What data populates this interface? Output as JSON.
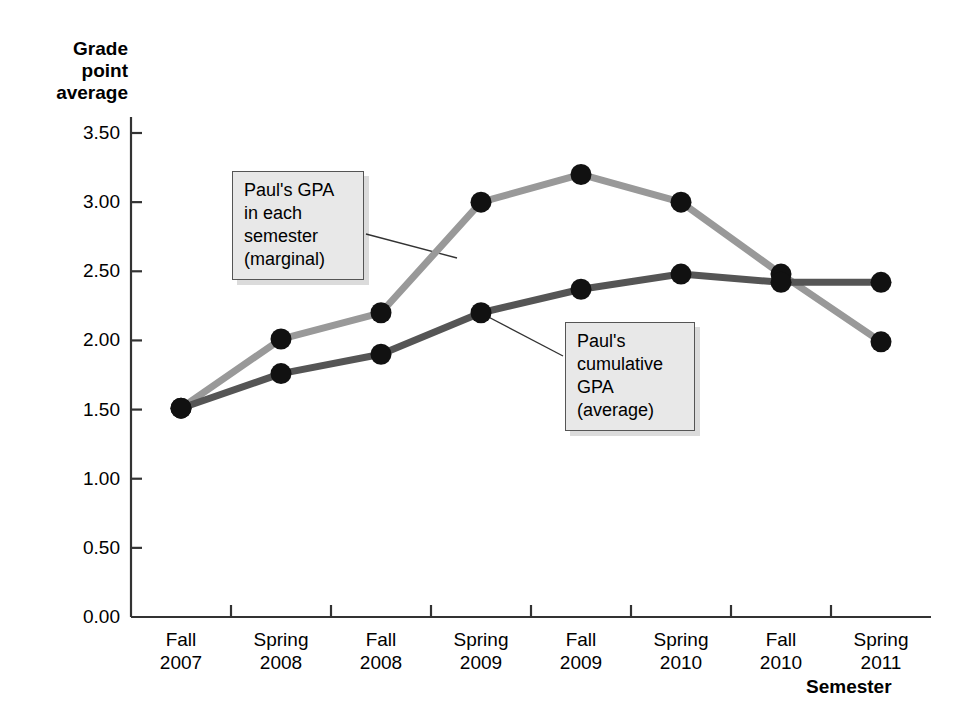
{
  "chart_data": {
    "type": "line",
    "title": "",
    "xlabel": "Semester",
    "ylabel": "Grade point average",
    "categories": [
      "Fall\n2007",
      "Spring\n2008",
      "Fall\n2008",
      "Spring\n2009",
      "Fall\n2009",
      "Spring\n2010",
      "Fall\n2010",
      "Spring\n2011"
    ],
    "ylim": [
      0.0,
      3.5
    ],
    "ytick_labels": [
      "3.50",
      "3.00",
      "2.50",
      "2.00",
      "1.50",
      "1.00",
      "0.50",
      "0.00"
    ],
    "ytick_values": [
      3.5,
      3.0,
      2.5,
      2.0,
      1.5,
      1.0,
      0.5,
      0.0
    ],
    "grid": false,
    "legend_position": "none",
    "series": [
      {
        "name": "Paul's GPA in each semester (marginal)",
        "color": "#999999",
        "values": [
          1.51,
          2.01,
          2.2,
          3.0,
          3.2,
          3.0,
          2.48,
          1.99
        ]
      },
      {
        "name": "Paul's cumulative GPA (average)",
        "color": "#555555",
        "values": [
          1.51,
          1.76,
          1.9,
          2.2,
          2.37,
          2.48,
          2.42,
          2.42
        ]
      }
    ],
    "annotations": [
      {
        "id": "marginal",
        "text": "Paul's GPA\nin each\nsemester\n(marginal)",
        "target_series": 0,
        "target_index": 3
      },
      {
        "id": "cumulative",
        "text": "Paul's\ncumulative\nGPA\n(average)",
        "target_series": 1,
        "target_index": 4
      }
    ],
    "marker": "filled-circle",
    "marker_color": "#111111"
  },
  "axes": {
    "y_title": "Grade\npoint\naverage",
    "x_title": "Semester"
  }
}
